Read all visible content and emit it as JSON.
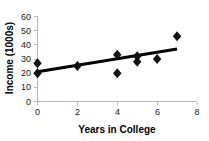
{
  "chart_data": {
    "type": "scatter",
    "title": "",
    "xlabel": "Years in College",
    "ylabel": "Income (1000s)",
    "xlim": [
      0,
      8
    ],
    "ylim": [
      0,
      60
    ],
    "xticks": [
      0,
      2,
      4,
      6,
      8
    ],
    "yticks": [
      0,
      10,
      20,
      30,
      40,
      50,
      60
    ],
    "xtick_labels": [
      "0",
      "2",
      "4",
      "6",
      "8"
    ],
    "ytick_labels": [
      "0",
      "10",
      "20",
      "30",
      "40",
      "50",
      "60"
    ],
    "grid": false,
    "legend": null,
    "marker": "diamond",
    "marker_color": "#111111",
    "points": [
      {
        "x": 0,
        "y": 27
      },
      {
        "x": 0,
        "y": 20
      },
      {
        "x": 2,
        "y": 25
      },
      {
        "x": 4,
        "y": 33
      },
      {
        "x": 4,
        "y": 20
      },
      {
        "x": 5,
        "y": 32
      },
      {
        "x": 5,
        "y": 28
      },
      {
        "x": 6,
        "y": 30
      },
      {
        "x": 7,
        "y": 46
      }
    ],
    "x": [
      0,
      0,
      2,
      4,
      4,
      5,
      5,
      6,
      7
    ],
    "values": [
      27,
      20,
      25,
      33,
      20,
      32,
      28,
      30,
      46
    ],
    "trendline": {
      "type": "linear",
      "color": "#000000",
      "x_start": 0,
      "y_start": 21,
      "x_end": 7,
      "y_end": 37
    }
  },
  "axes": {
    "x_title": "Years in College",
    "y_title": "Income (1000s)",
    "axis_color": "#b9b9b9"
  }
}
